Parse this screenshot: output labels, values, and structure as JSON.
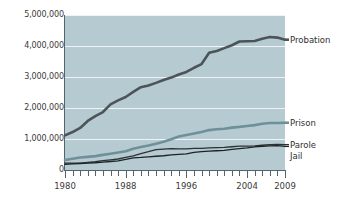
{
  "chart_data": {
    "type": "line",
    "title": "",
    "subtitle": "",
    "xlabel": "",
    "ylabel": "",
    "xlim": [
      1980,
      2009
    ],
    "ylim": [
      0,
      5000000
    ],
    "grid": true,
    "legend_position": "right-inline",
    "y_ticks": [
      0,
      1000000,
      2000000,
      3000000,
      4000000,
      5000000
    ],
    "y_tick_labels": [
      "0",
      "1,000,000",
      "2,000,000",
      "3,000,000",
      "4,000,000",
      "5,000,000"
    ],
    "x_ticks": [
      1980,
      1988,
      1996,
      2004,
      2009
    ],
    "x_tick_labels": [
      "1980",
      "1988",
      "1996",
      "2004",
      "2009"
    ],
    "x_minor_ticks_every_year": true,
    "x": [
      1980,
      1981,
      1982,
      1983,
      1984,
      1985,
      1986,
      1987,
      1988,
      1989,
      1990,
      1991,
      1992,
      1993,
      1994,
      1995,
      1996,
      1997,
      1998,
      1999,
      2000,
      2001,
      2002,
      2003,
      2004,
      2005,
      2006,
      2007,
      2008,
      2009
    ],
    "series": [
      {
        "name": "Probation",
        "color": "#4d5458",
        "width": 2.6,
        "label_value": 4203000,
        "values": [
          1118000,
          1225000,
          1357000,
          1582000,
          1740000,
          1870000,
          2115000,
          2247000,
          2356000,
          2522000,
          2670000,
          2729000,
          2811000,
          2903000,
          2981000,
          3078000,
          3164000,
          3297000,
          3417000,
          3779000,
          3839000,
          3932000,
          4024000,
          4144000,
          4151000,
          4163000,
          4237000,
          4293000,
          4271000,
          4203000
        ]
      },
      {
        "name": "Prison",
        "color": "#6f9099",
        "width": 2.6,
        "label_value": 1524000,
        "values": [
          320000,
          360000,
          402000,
          424000,
          448000,
          487000,
          526000,
          562000,
          607000,
          683000,
          743000,
          792000,
          850000,
          909000,
          990000,
          1078000,
          1127000,
          1176000,
          1224000,
          1287000,
          1316000,
          1330000,
          1367000,
          1390000,
          1421000,
          1448000,
          1492000,
          1517000,
          1518000,
          1524000
        ]
      },
      {
        "name": "Parole",
        "color": "#2b3134",
        "width": 1.3,
        "label_value": 819000,
        "values": [
          220000,
          225000,
          224000,
          246000,
          266000,
          300000,
          325000,
          355000,
          407000,
          456000,
          531000,
          590000,
          658000,
          676000,
          690000,
          679000,
          680000,
          695000,
          696000,
          714000,
          724000,
          732000,
          750000,
          769000,
          771000,
          780000,
          799000,
          821000,
          828000,
          819000
        ]
      },
      {
        "name": "Jail",
        "color": "#1d2326",
        "width": 1.3,
        "label_value": 760000,
        "values": [
          182000,
          196000,
          210000,
          224000,
          234000,
          256000,
          274000,
          295000,
          341000,
          393000,
          405000,
          426000,
          444000,
          459000,
          486000,
          507000,
          518000,
          567000,
          592000,
          606000,
          621000,
          631000,
          665000,
          691000,
          714000,
          747000,
          766000,
          780000,
          785000,
          760000
        ]
      }
    ]
  }
}
